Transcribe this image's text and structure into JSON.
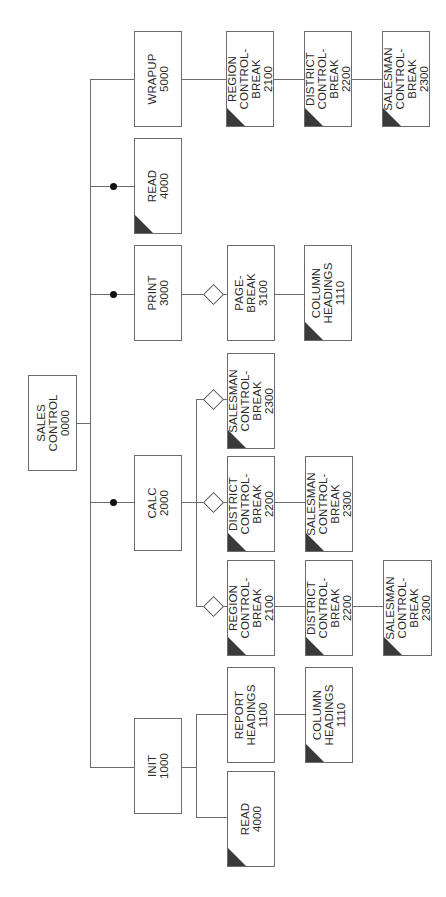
{
  "diagram": {
    "type": "structure-chart",
    "orientation": "rotated-90-ccw-text",
    "colors": {
      "line": "#6b6b6b",
      "shade": "#3a3a3a",
      "dot": "#111111",
      "background": "#ffffff"
    },
    "root": {
      "id": "0000",
      "label": "SALES\nCONTROL\n0000"
    },
    "modules": [
      {
        "key": "wrapup",
        "label": "WRAPUP\n5000"
      },
      {
        "key": "read_main",
        "label": "READ\n4000",
        "shaded": true,
        "loop": true
      },
      {
        "key": "print",
        "label": "PRINT\n3000",
        "loop": true
      },
      {
        "key": "calc",
        "label": "CALC\n2000",
        "loop": true
      },
      {
        "key": "init",
        "label": "INIT\n1000"
      },
      {
        "key": "wrapup_region",
        "label": "REGION\nCONTROL-\nBREAK\n2100",
        "shaded": true
      },
      {
        "key": "wrapup_district",
        "label": "DISTRICT\nCONTROL-\nBREAK\n2200",
        "shaded": true
      },
      {
        "key": "wrapup_salesman",
        "label": "SALESMAN\nCONTROL-\nBREAK\n2300",
        "shaded": true
      },
      {
        "key": "print_pagebreak",
        "label": "PAGE-\nBREAK\n3100",
        "conditional": true
      },
      {
        "key": "print_colhead",
        "label": "COLUMN\nHEADINGS\n1110",
        "shaded": true
      },
      {
        "key": "calc_salesman",
        "label": "SALESMAN\nCONTROL-\nBREAK\n2300",
        "shaded": true,
        "conditional": true
      },
      {
        "key": "calc_district",
        "label": "DISTRICT\nCONTROL-\nBREAK\n2200",
        "shaded": true,
        "conditional": true
      },
      {
        "key": "calc_district_salesman",
        "label": "SALESMAN\nCONTROL-\nBREAK\n2300",
        "shaded": true
      },
      {
        "key": "calc_region",
        "label": "REGION\nCONTROL-\nBREAK\n2100",
        "shaded": true,
        "conditional": true
      },
      {
        "key": "calc_region_district",
        "label": "DISTRICT\nCONTROL-\nBREAK\n2200",
        "shaded": true
      },
      {
        "key": "calc_region_salesman",
        "label": "SALESMAN\nCONTROL-\nBREAK\n2300",
        "shaded": true
      },
      {
        "key": "init_reporthead",
        "label": "REPORT\nHEADINGS\n1100"
      },
      {
        "key": "init_colhead",
        "label": "COLUMN\nHEADINGS\n1110",
        "shaded": true
      },
      {
        "key": "init_read",
        "label": "READ\n4000",
        "shaded": true
      }
    ]
  }
}
